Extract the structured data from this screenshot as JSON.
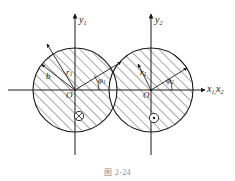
{
  "figure": {
    "caption": "图 2-24",
    "stroke_color": "#1a1a1a",
    "hatch_color": "#262626",
    "background": "#ffffff"
  },
  "axes": {
    "y1_label": "y",
    "y1_sub": "1",
    "y2_label": "y",
    "y2_sub": "2",
    "x_label": "x",
    "x_sub_1": "1,",
    "x_sub_2": "x",
    "x_sub_3": "2",
    "x_axis_full": "x1,x2"
  },
  "left_circle": {
    "origin_label": "O",
    "radius_label": "r",
    "radius_sub": "1",
    "angle_label": "φ",
    "angle_sub": "1",
    "distance_label": "b",
    "current_symbol": "⊗",
    "current_symbol_name": "current-into-page",
    "cx": 75,
    "cy": 90,
    "r": 42
  },
  "right_circle": {
    "origin_label": "O",
    "radius_label": "r",
    "radius_sub": "2",
    "angle_label": "φ",
    "angle_sub": "2",
    "current_symbol": "⊙",
    "current_symbol_name": "current-out-of-page",
    "cx": 151,
    "cy": 90,
    "r": 42
  }
}
